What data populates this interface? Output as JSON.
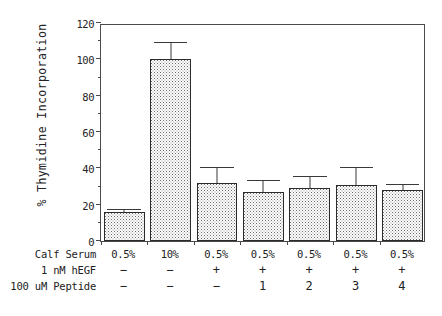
{
  "chart_data": {
    "type": "bar",
    "title": "",
    "xlabel": "",
    "ylabel": "% Thymidine Incorporation",
    "ylim": [
      0,
      120
    ],
    "yticks": [
      0,
      20,
      40,
      60,
      80,
      100,
      120
    ],
    "ytick_labels": [
      "0",
      "20",
      "40",
      "60",
      "80",
      "100",
      "120"
    ],
    "minor_tick_interval": 10,
    "grid": false,
    "legend": "none",
    "categories": [
      "1",
      "2",
      "3",
      "4",
      "5",
      "6",
      "7"
    ],
    "values": [
      16,
      100,
      32,
      27,
      29,
      31,
      28
    ],
    "errors": [
      1,
      9,
      8,
      6,
      6,
      9,
      3
    ],
    "error_style": "upper-only",
    "bar_fill": "stippled-dot-pattern",
    "bar_edge_color": "#2b2b2b",
    "condition_table": {
      "rows": [
        {
          "label": "Calf Serum",
          "values": [
            "0.5%",
            "10%",
            "0.5%",
            "0.5%",
            "0.5%",
            "0.5%",
            "0.5%"
          ]
        },
        {
          "label": "1 nM hEGF",
          "values": [
            "−",
            "−",
            "+",
            "+",
            "+",
            "+",
            "+"
          ]
        },
        {
          "label": "100 uM Peptide",
          "values": [
            "−",
            "−",
            "−",
            "1",
            "2",
            "3",
            "4"
          ]
        }
      ]
    }
  },
  "axis": {
    "y_title": "% Thymidine Incorporation"
  }
}
